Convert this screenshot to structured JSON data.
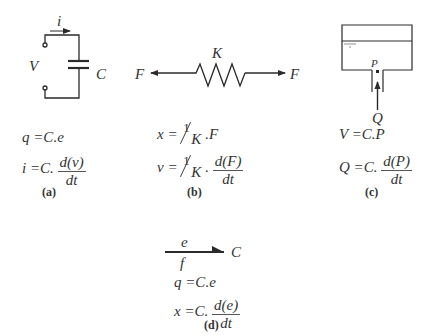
{
  "figure": {
    "panels": [
      {
        "id": "a",
        "caption": "(a)",
        "title": "Electrical capacitor",
        "labels": {
          "current": "i",
          "voltage": "V",
          "capacitance": "C"
        },
        "equations": [
          {
            "lhs": "q",
            "rhs_prefix": "=C",
            "rhs_suffix": ".e"
          },
          {
            "lhs": "i",
            "rhs_prefix": "=C.",
            "numerator": "d(v)",
            "denominator": "dt"
          }
        ]
      },
      {
        "id": "b",
        "caption": "(b)",
        "title": "Mechanical spring",
        "labels": {
          "stiffness": "K",
          "force_left": "F",
          "force_right": "F"
        },
        "equations": [
          {
            "lhs": "x",
            "eq": "=",
            "frac_num": "1",
            "frac_den": "K",
            "rhs_suffix": ".F"
          },
          {
            "lhs": "v",
            "eq": "=",
            "frac_num": "1",
            "frac_den": "K",
            "rhs_mid": ".",
            "numerator": "d(F)",
            "denominator": "dt"
          }
        ]
      },
      {
        "id": "c",
        "caption": "(c)",
        "title": "Hydraulic tank",
        "labels": {
          "pressure": "P",
          "flow": "Q"
        },
        "equations": [
          {
            "lhs": "V",
            "rhs": "=C.P"
          },
          {
            "lhs": "Q",
            "rhs_prefix": "=C.",
            "numerator": "d(P)",
            "denominator": "dt"
          }
        ]
      },
      {
        "id": "d",
        "caption": "(d)",
        "title": "Bond graph C element",
        "labels": {
          "effort": "e",
          "flow": "f",
          "element": "C"
        },
        "equations": [
          {
            "lhs": "q",
            "rhs_prefix": "=C",
            "rhs_suffix": ".e"
          },
          {
            "lhs": "x",
            "rhs_prefix": "=C.",
            "numerator": "d(e)",
            "denominator": "dt"
          }
        ]
      }
    ],
    "colors": {
      "stroke": "#2a2a2a",
      "text": "#333333",
      "background": "#ffffff"
    }
  }
}
